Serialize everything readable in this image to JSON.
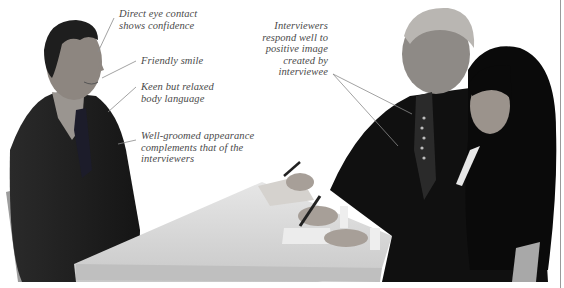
{
  "figure": {
    "colors": {
      "background": "#ffffff",
      "suit_dark": "#1a1a1a",
      "table": "#d9d9d9",
      "skin": "#b8b0a8",
      "label_text": "#4a4a4a",
      "leader_line": "#8a8a8a",
      "border": "#9a9a9a"
    }
  },
  "annotations": {
    "eye_contact": [
      "Direct eye contact",
      "shows confidence"
    ],
    "smile": [
      "Friendly smile"
    ],
    "body_language": [
      "Keen but relaxed",
      "body language"
    ],
    "appearance": [
      "Well-groomed appearance",
      "complements that of the",
      "interviewers"
    ],
    "interviewers": [
      "Interviewers",
      "respond well to",
      "positive image",
      "created by",
      "interviewee"
    ]
  }
}
